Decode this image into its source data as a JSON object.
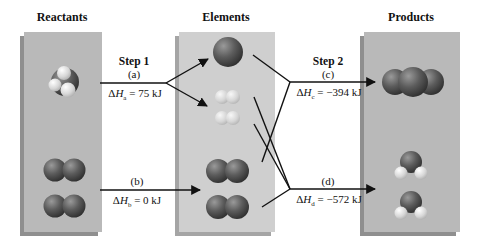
{
  "columns": {
    "reactants": "Reactants",
    "elements": "Elements",
    "products": "Products"
  },
  "steps": {
    "step1": "Step 1",
    "step2": "Step 2"
  },
  "reactions": {
    "a": {
      "tag": "(a)",
      "delta_prefix": "ΔH",
      "sub": "a",
      "value": "= 75 kJ"
    },
    "b": {
      "tag": "(b)",
      "delta_prefix": "ΔH",
      "sub": "b",
      "value": "= 0 kJ"
    },
    "c": {
      "tag": "(c)",
      "delta_prefix": "ΔH",
      "sub": "c",
      "value": "= −394 kJ"
    },
    "d": {
      "tag": "(d)",
      "delta_prefix": "ΔH",
      "sub": "d",
      "value": "= −572 kJ"
    }
  },
  "molecules": {
    "reactants": [
      "methane",
      "oxygen",
      "oxygen"
    ],
    "elements": [
      "carbon",
      "hydrogen",
      "hydrogen",
      "oxygen",
      "oxygen"
    ],
    "products": [
      "carbon-dioxide",
      "water",
      "water"
    ]
  },
  "colors": {
    "panel": "#b9b9b9",
    "panel_elements": "#cfcfcf",
    "atom_dark": "#555555",
    "atom_light": "#e6e6e6",
    "arrow": "#111111"
  }
}
